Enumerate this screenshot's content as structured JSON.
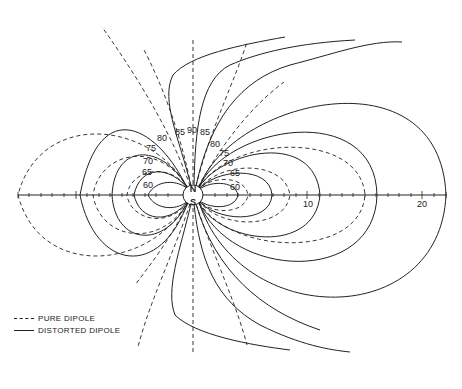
{
  "diagram": {
    "poles": {
      "north": "N",
      "south": "S"
    },
    "latitude_labels_left": [
      "80",
      "75",
      "70",
      "65",
      "60"
    ],
    "latitude_labels_top": [
      "85",
      "90",
      "85"
    ],
    "latitude_labels_right": [
      "80",
      "75",
      "70",
      "65",
      "60"
    ],
    "axis_ticks": [
      {
        "label": "10"
      },
      {
        "label": "20"
      }
    ],
    "legend": {
      "dashed": "PURE DIPOLE",
      "solid": "DISTORTED DIPOLE"
    }
  }
}
